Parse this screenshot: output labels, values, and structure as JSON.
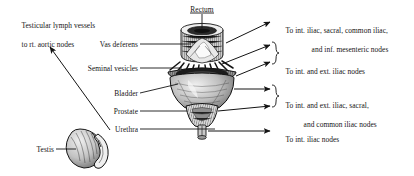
{
  "figure": {
    "type": "anatomical-lymphatic-drainage-diagram",
    "background_color": "#ffffff",
    "ink_color": "#141414"
  },
  "labels": {
    "testicular_lymph_vessels": {
      "line1": "Testicular lymph vessels",
      "line2": "to rt. aortic nodes"
    },
    "rectum": "Rectum",
    "vas_deferens": "Vas deferens",
    "seminal_vesicles": "Seminal vesicles",
    "bladder": "Bladder",
    "prostate": "Prostate",
    "urethra": "Urethra",
    "testis": "Testis"
  },
  "drainage_targets": [
    {
      "id": "rectum-drainage",
      "line1": "To int. iliac, sacral, common iliac,",
      "line2": "and inf. mesenteric nodes",
      "braced": false,
      "arrows": 1
    },
    {
      "id": "vesicle-deferens-drainage",
      "line1": "To int. and ext. iliac nodes",
      "line2": "",
      "braced": true,
      "arrows": 2
    },
    {
      "id": "bladder-prostate-drainage",
      "line1": "To int. and ext. iliac, sacral,",
      "line2": "and common iliac nodes",
      "braced": true,
      "arrows": 2
    },
    {
      "id": "urethra-drainage",
      "line1": "To int. iliac nodes",
      "line2": "",
      "braced": false,
      "arrows": 1
    }
  ],
  "structures": [
    {
      "name": "rectum",
      "description": "cylindrical segment at top of illustration"
    },
    {
      "name": "vas-deferens",
      "description": "duct entering upper body of specimen"
    },
    {
      "name": "seminal-vesicles",
      "description": "radiating fringed band below rectum"
    },
    {
      "name": "bladder",
      "description": "large rounded body in center"
    },
    {
      "name": "prostate",
      "description": "conical mass below bladder"
    },
    {
      "name": "urethra",
      "description": "short stem at base"
    },
    {
      "name": "testis",
      "description": "ovoid organ with epididymis at lower left"
    }
  ]
}
